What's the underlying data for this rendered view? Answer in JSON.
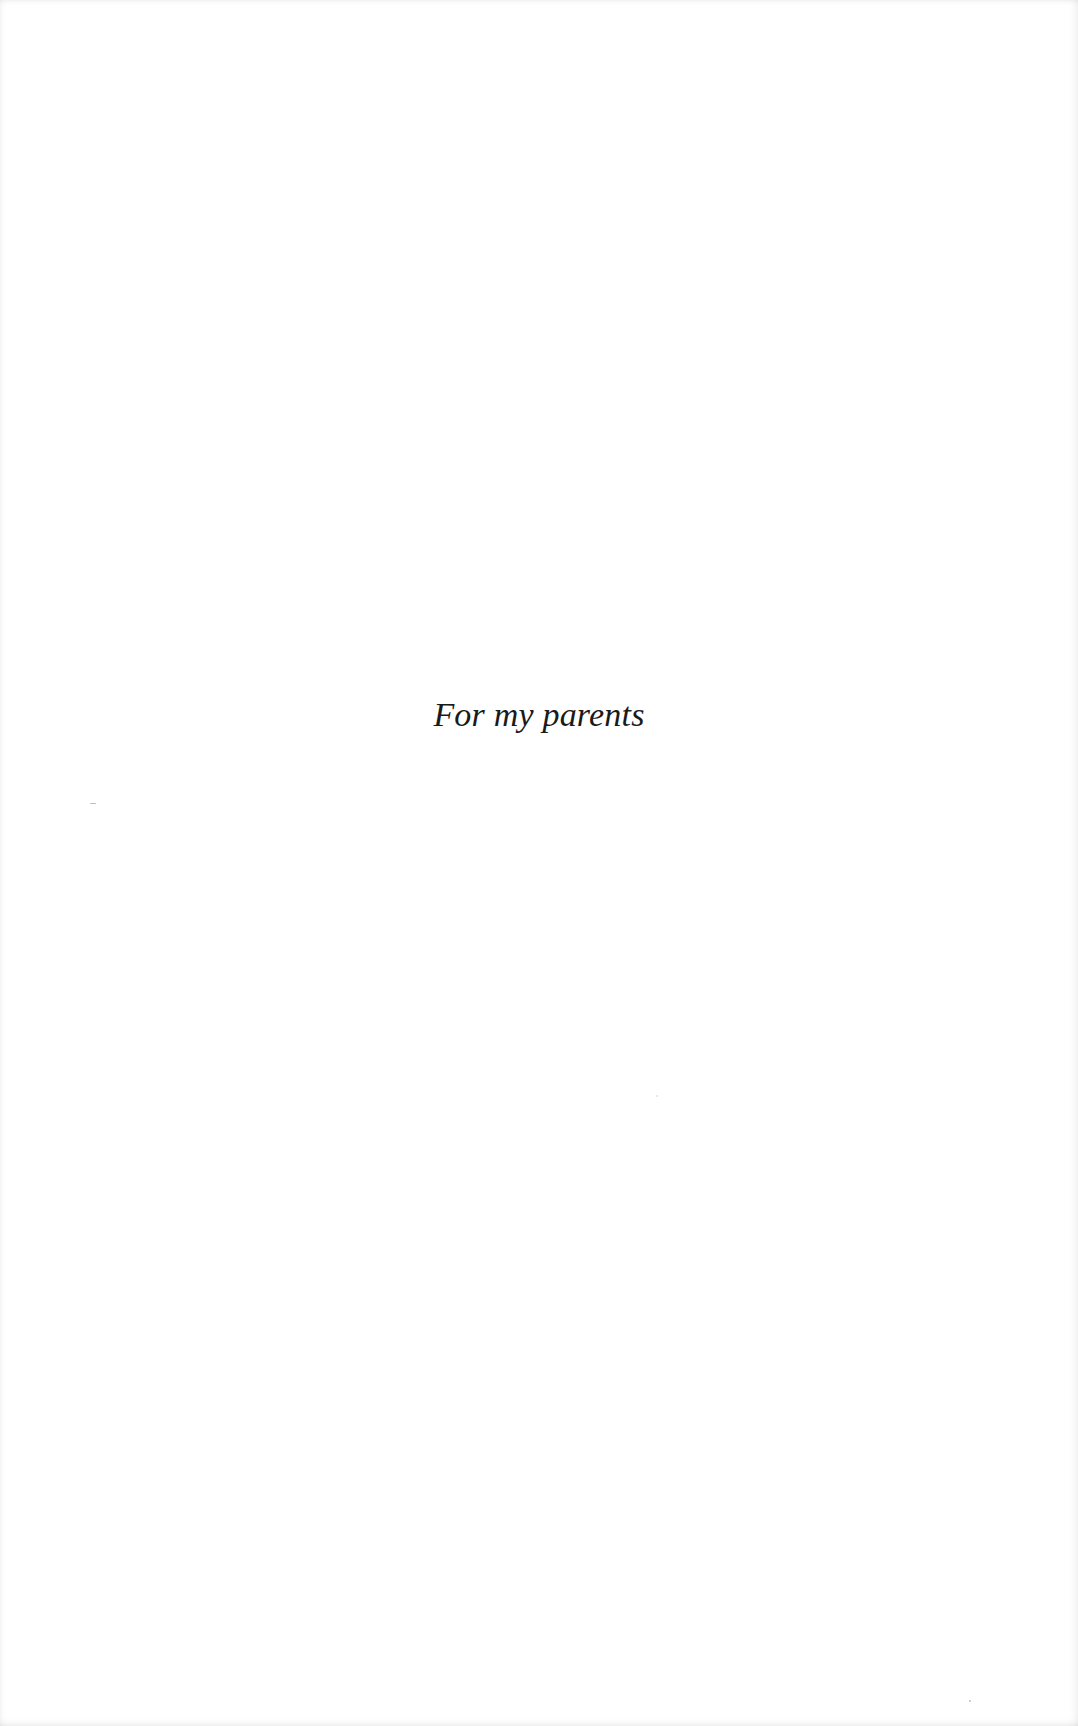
{
  "page": {
    "type": "dedication",
    "text": "For my parents",
    "background_color": "#ffffff",
    "text_color": "#1a1a1a"
  }
}
